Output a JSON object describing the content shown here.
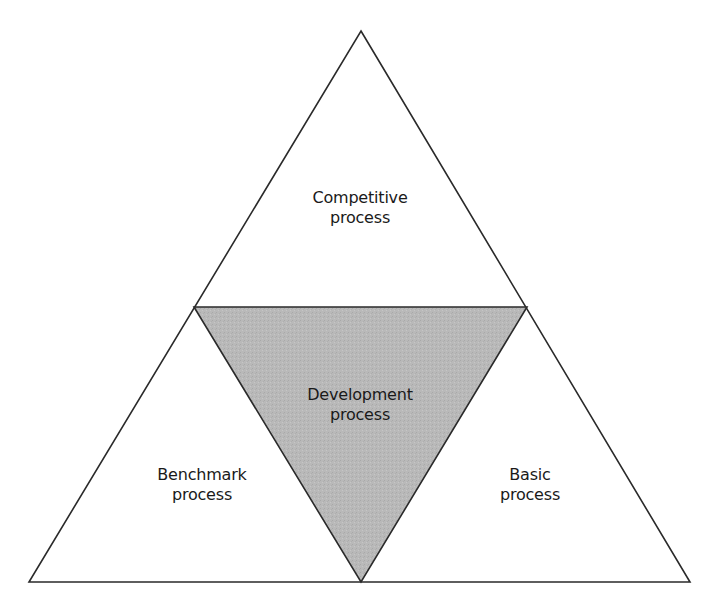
{
  "diagram": {
    "type": "triangle-of-triangles",
    "colors": {
      "outline": "#2a2a2a",
      "background": "#ffffff",
      "center_fill": "#b8b8b8"
    },
    "sections": {
      "top": {
        "line1": "Competitive",
        "line2": "process"
      },
      "center": {
        "line1": "Development",
        "line2": "process"
      },
      "left": {
        "line1": "Benchmark",
        "line2": "process"
      },
      "right": {
        "line1": "Basic",
        "line2": "process"
      }
    }
  }
}
